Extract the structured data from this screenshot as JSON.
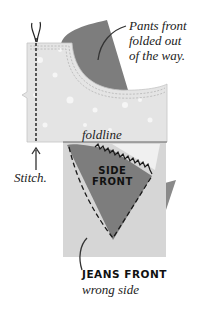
{
  "callouts": {
    "pants_front": {
      "lines": [
        "Pants front",
        "folded out",
        "of the way."
      ]
    },
    "stitch": "Stitch.",
    "foldline": "foldline",
    "side_front": {
      "lines": [
        "SIDE",
        "FRONT"
      ]
    },
    "jeans_front": {
      "title": "JEANS FRONT",
      "subtitle": "wrong side"
    }
  },
  "colors": {
    "dark_fabric": "#7a7a7a",
    "light_fabric": "#d9d9d9",
    "pocket_fabric": "#e6e6e6",
    "stitch": "#1a1a1a",
    "text": "#222222"
  }
}
